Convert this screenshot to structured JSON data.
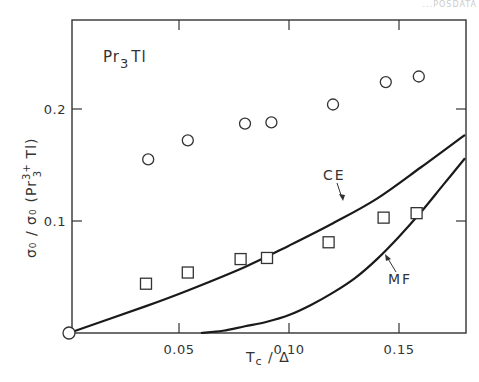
{
  "corner_text": "...POSDATA",
  "chart_data": {
    "type": "scatter",
    "title": "Pr3Tl",
    "annotation_label": "Pr₃Tl",
    "xlabel": "Tc / Δ",
    "ylabel": "σ₀ / σ₀ (Pr₃³⁺ Tl)",
    "xlim": [
      0,
      0.18
    ],
    "ylim": [
      0,
      0.28
    ],
    "x_ticks": [
      0.05,
      0.1,
      0.15
    ],
    "x_tick_labels": [
      "0.05",
      "0.10",
      "0.15"
    ],
    "y_ticks": [
      0.1,
      0.2
    ],
    "y_tick_labels": [
      "0.1",
      "0.2"
    ],
    "grid": false,
    "legend": null,
    "series": [
      {
        "name": "circles",
        "marker": "circle",
        "x": [
          0.036,
          0.054,
          0.08,
          0.092,
          0.12,
          0.144,
          0.159
        ],
        "y": [
          0.155,
          0.172,
          0.187,
          0.188,
          0.204,
          0.224,
          0.229
        ]
      },
      {
        "name": "squares",
        "marker": "square",
        "x": [
          0.035,
          0.054,
          0.078,
          0.09,
          0.118,
          0.143,
          0.158
        ],
        "y": [
          0.044,
          0.054,
          0.066,
          0.067,
          0.081,
          0.103,
          0.107
        ]
      },
      {
        "name": "CE",
        "type": "line",
        "x": [
          0.0,
          0.035,
          0.054,
          0.08,
          0.1,
          0.12,
          0.14,
          0.16,
          0.18
        ],
        "y": [
          0.0,
          0.024,
          0.038,
          0.059,
          0.078,
          0.098,
          0.12,
          0.148,
          0.177
        ]
      },
      {
        "name": "MF",
        "type": "line",
        "x": [
          0.06,
          0.07,
          0.08,
          0.09,
          0.1,
          0.11,
          0.12,
          0.13,
          0.14,
          0.15,
          0.16,
          0.17,
          0.18
        ],
        "y": [
          0.0,
          0.002,
          0.006,
          0.01,
          0.016,
          0.025,
          0.036,
          0.049,
          0.066,
          0.086,
          0.108,
          0.132,
          0.156
        ]
      },
      {
        "name": "origin",
        "marker": "circle",
        "x": [
          0.0
        ],
        "y": [
          0.0
        ]
      }
    ],
    "annotations": [
      {
        "text": "CE",
        "x": 0.111,
        "y": 0.145,
        "arrow_to": [
          0.115,
          0.093
        ]
      },
      {
        "text": "MF",
        "x": 0.15,
        "y": 0.036,
        "arrow_to": [
          0.143,
          0.065
        ]
      }
    ]
  },
  "labels": {
    "pr": "Pr",
    "sub3": "3",
    "tl": "Tl",
    "ce": "CE",
    "mf": "MF",
    "xaxis_t": "T",
    "xaxis_c": "c",
    "xaxis_rest": " / Δ",
    "yaxis_main": "σ₀ / σ₀",
    "yaxis_paren_open": "(Pr",
    "yaxis_sup": "3+",
    "yaxis_sub": "3",
    "yaxis_rest": " Tl)"
  }
}
